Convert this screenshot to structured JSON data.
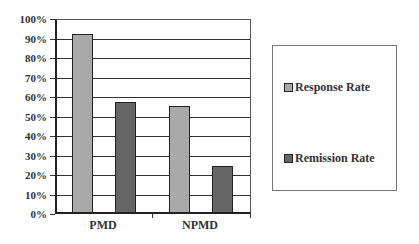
{
  "chart_data": {
    "type": "bar",
    "title": "",
    "xlabel": "",
    "ylabel": "",
    "categories": [
      "PMD",
      "NPMD"
    ],
    "series": [
      {
        "name": "Response Rate",
        "values": [
          92,
          55
        ],
        "color": "#a9a9a9"
      },
      {
        "name": "Remission Rate",
        "values": [
          57,
          24
        ],
        "color": "#666666"
      }
    ],
    "ylim": [
      0,
      100
    ],
    "yticks": [
      "0%",
      "10%",
      "20%",
      "30%",
      "40%",
      "50%",
      "60%",
      "70%",
      "80%",
      "90%",
      "100%"
    ],
    "grid": true,
    "legend_position": "right",
    "units": "%"
  },
  "legend": {
    "items": [
      {
        "label": "Response Rate",
        "color": "#a9a9a9"
      },
      {
        "label": "Remission Rate",
        "color": "#666666"
      }
    ]
  },
  "axis": {
    "x_labels": [
      "PMD",
      "NPMD"
    ],
    "y_labels": [
      "100%",
      "90%",
      "80%",
      "70%",
      "60%",
      "50%",
      "40%",
      "30%",
      "20%",
      "10%",
      "0%"
    ]
  }
}
